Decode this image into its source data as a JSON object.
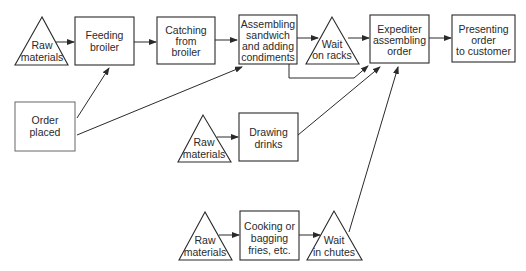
{
  "diagram": {
    "type": "process-flow",
    "colors": {
      "stroke": "#2a2a2a",
      "background": "#ffffff",
      "text": "#2a2a2a"
    },
    "nodes": [
      {
        "id": "raw1",
        "shape": "triangle",
        "lines": [
          "Raw",
          "materials"
        ]
      },
      {
        "id": "feeding",
        "shape": "rect",
        "lines": [
          "Feeding",
          "broiler"
        ]
      },
      {
        "id": "catching",
        "shape": "rect",
        "lines": [
          "Catching",
          "from",
          "broiler"
        ]
      },
      {
        "id": "assembling",
        "shape": "rect",
        "lines": [
          "Assembling",
          "sandwich",
          "and adding",
          "condiments"
        ]
      },
      {
        "id": "wait_racks",
        "shape": "triangle",
        "lines": [
          "Wait",
          "on racks"
        ]
      },
      {
        "id": "expediter",
        "shape": "rect",
        "lines": [
          "Expediter",
          "assembling",
          "order"
        ]
      },
      {
        "id": "presenting",
        "shape": "rect",
        "lines": [
          "Presenting",
          "order",
          "to customer"
        ]
      },
      {
        "id": "order",
        "shape": "rect",
        "lines": [
          "Order",
          "placed"
        ]
      },
      {
        "id": "raw2",
        "shape": "triangle",
        "lines": [
          "Raw",
          "materials"
        ]
      },
      {
        "id": "drawing",
        "shape": "rect",
        "lines": [
          "Drawing",
          "drinks"
        ]
      },
      {
        "id": "raw3",
        "shape": "triangle",
        "lines": [
          "Raw",
          "materials"
        ]
      },
      {
        "id": "cooking",
        "shape": "rect",
        "lines": [
          "Cooking or",
          "bagging",
          "fries, etc."
        ]
      },
      {
        "id": "wait_chutes",
        "shape": "triangle",
        "lines": [
          "Wait",
          "in chutes"
        ]
      }
    ],
    "edges": [
      {
        "from": "raw1",
        "to": "feeding"
      },
      {
        "from": "feeding",
        "to": "catching"
      },
      {
        "from": "catching",
        "to": "assembling"
      },
      {
        "from": "assembling",
        "to": "wait_racks"
      },
      {
        "from": "assembling",
        "to": "expediter",
        "via": "bypass-below-racks"
      },
      {
        "from": "wait_racks",
        "to": "expediter"
      },
      {
        "from": "expediter",
        "to": "presenting"
      },
      {
        "from": "order",
        "to": "feeding"
      },
      {
        "from": "order",
        "to": "assembling"
      },
      {
        "from": "raw2",
        "to": "drawing"
      },
      {
        "from": "drawing",
        "to": "expediter"
      },
      {
        "from": "raw3",
        "to": "cooking"
      },
      {
        "from": "cooking",
        "to": "wait_chutes"
      },
      {
        "from": "wait_chutes",
        "to": "expediter"
      }
    ]
  }
}
